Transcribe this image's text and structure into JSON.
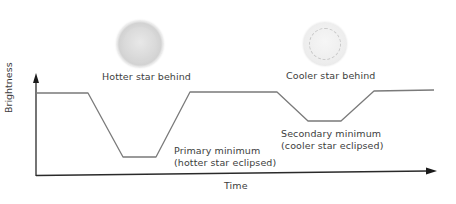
{
  "diagram": {
    "stars": [
      {
        "label": "Hotter star behind",
        "icon": "hot-star-icon"
      },
      {
        "label": "Cooler star behind",
        "icon": "cool-star-icon"
      }
    ],
    "axes": {
      "ylabel": "Brightness",
      "xlabel": "Time"
    },
    "annotations": {
      "primary": {
        "line1": "Primary minimum",
        "line2": "(hotter star eclipsed)"
      },
      "secondary": {
        "line1": "Secondary  minimum",
        "line2": "(cooler star eclipsed)"
      }
    },
    "light_curve": {
      "points": [
        [
          36,
          93
        ],
        [
          88,
          93
        ],
        [
          123,
          157
        ],
        [
          156,
          157
        ],
        [
          190,
          92
        ],
        [
          277,
          92
        ],
        [
          308,
          121
        ],
        [
          341,
          121
        ],
        [
          374,
          91
        ],
        [
          434,
          90
        ]
      ],
      "color": "#7a7a7a"
    },
    "colors": {
      "axis": "#2a2a2a",
      "curve": "#7a7a7a",
      "text": "#3d3d3d"
    }
  }
}
